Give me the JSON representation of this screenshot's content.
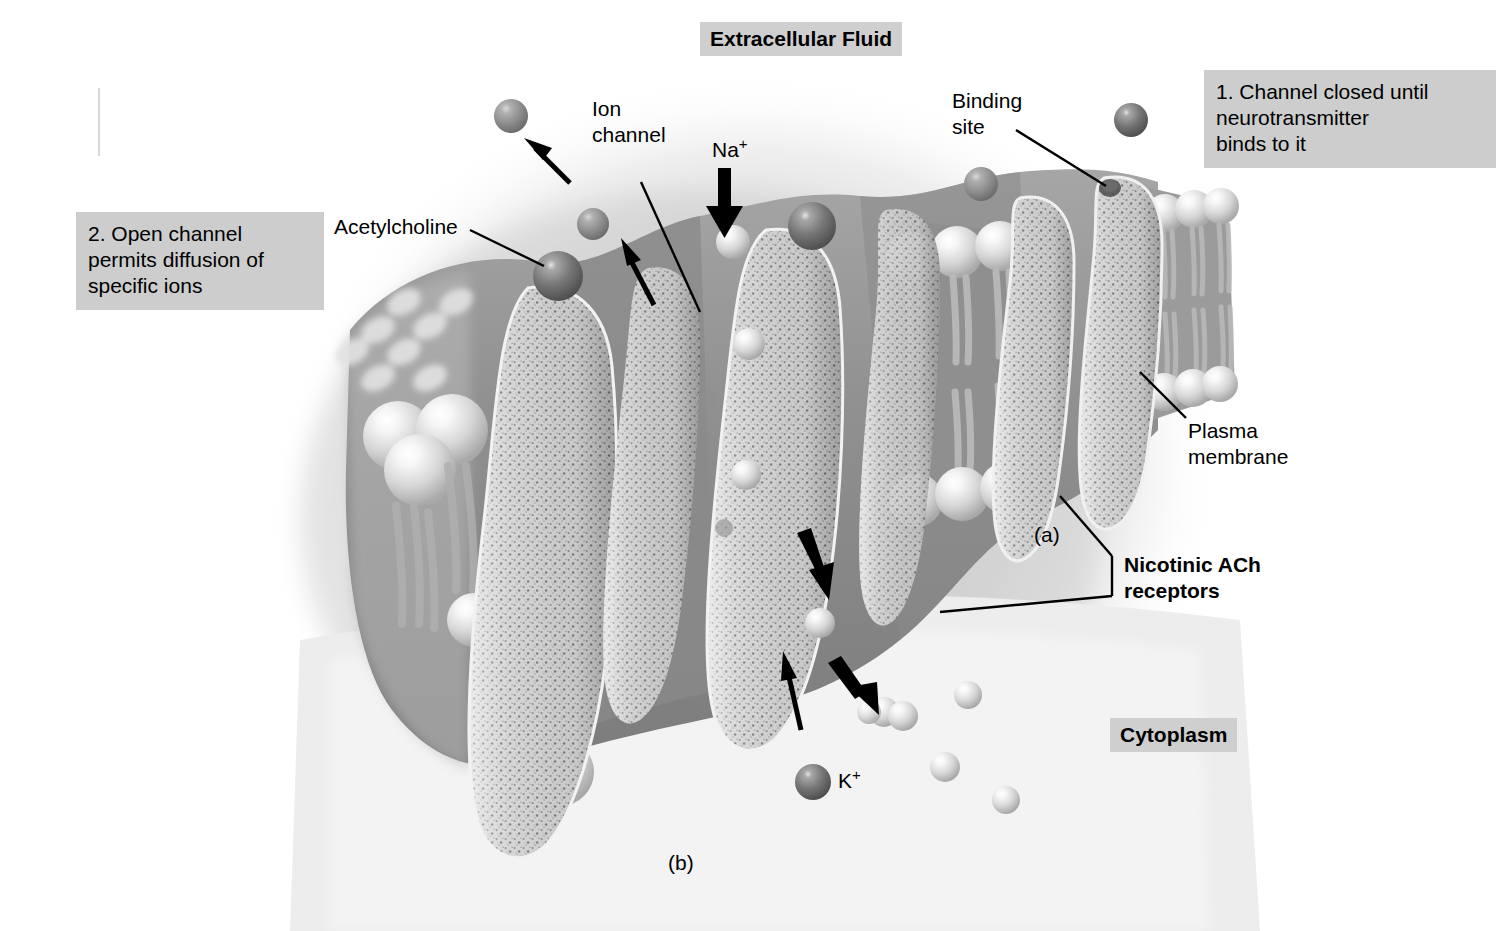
{
  "figure": {
    "title_top": "Extracellular Fluid",
    "title_bottom": "Cytoplasm",
    "panel_a": "(a)",
    "panel_b": "(b)"
  },
  "steps": [
    {
      "id": "step-2",
      "text": "2. Open channel\n    permits diffusion of\n    specific ions"
    },
    {
      "id": "step-1",
      "text": "1. Channel closed until\n    neurotransmitter\n    binds to it"
    }
  ],
  "labels": {
    "ion_channel": "Ion\nchannel",
    "sodium": "Na",
    "sodium_charge": "+",
    "potassium": "K",
    "potassium_charge": "+",
    "acetylcholine": "Acetylcholine",
    "binding_site": "Binding\nsite",
    "plasma_membrane": "Plasma\nmembrane",
    "receptors": "Nicotinic ACh\nreceptors"
  },
  "colors": {
    "background": "#ffffff",
    "label_box": "#cdcdcd",
    "title_box": "#cfcfcf",
    "membrane_body": "#9a9a9a",
    "membrane_shadow": "#7f7f7f",
    "subunit_speckle": "#d2d2d2",
    "subunit_edge": "#efefef",
    "acetylcholine_sphere": "#6e6e6e",
    "ion_sphere": "#e8e8e8",
    "lipid_head": "#dcdcdc",
    "arrow": "#000000",
    "text": "#000000"
  },
  "diagram_elements": {
    "receptor_subunits": 6,
    "acetylcholine_molecules": 4,
    "sodium_ions_in_channel": 6,
    "potassium_ions_cytoplasm": 5,
    "thick_arrows": 3,
    "thin_arrows": 3
  }
}
